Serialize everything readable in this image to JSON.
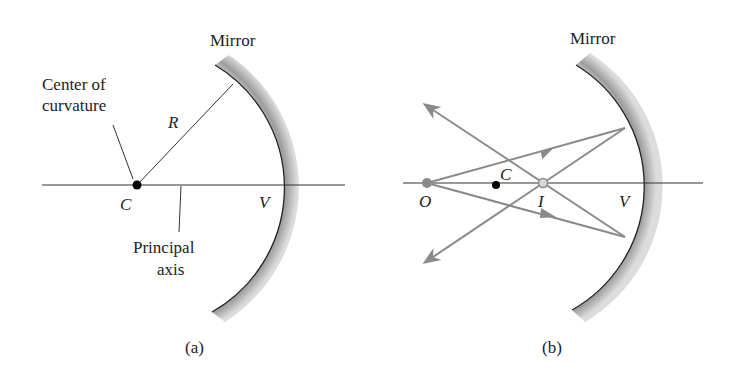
{
  "panel_a": {
    "mirror_label": "Mirror",
    "center_label_line1": "Center of",
    "center_label_line2": "curvature",
    "radius_label": "R",
    "center_point": "C",
    "vertex_point": "V",
    "axis_label_line1": "Principal",
    "axis_label_line2": "axis",
    "caption": "(a)"
  },
  "panel_b": {
    "mirror_label": "Mirror",
    "object_point": "O",
    "center_point": "C",
    "image_point": "I",
    "vertex_point": "V",
    "caption": "(b)"
  },
  "colors": {
    "ray": "#8a8a8a",
    "axis": "#333333",
    "mirror_edge": "#222222",
    "point_dark": "#000000"
  }
}
